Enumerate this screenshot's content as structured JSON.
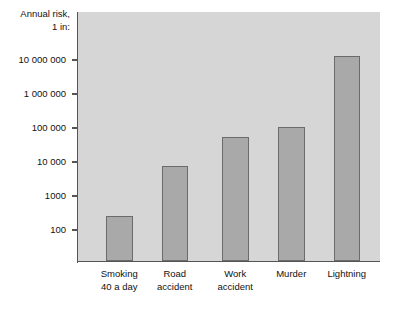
{
  "chart_data": {
    "type": "bar",
    "title": "",
    "subtitle": "",
    "ylabel": "Annual risk,\n1 in:",
    "ylabel_lines": [
      "Annual risk,",
      "1 in:"
    ],
    "xlabel": "",
    "yscale": "log",
    "ylim": [
      100,
      30000000
    ],
    "grid": false,
    "legend": "none",
    "categories": [
      "Smoking\n40 a day",
      "Road\naccident",
      "Work\naccident",
      "Murder",
      "Lightning"
    ],
    "category_lines": [
      [
        "Smoking",
        "40 a day"
      ],
      [
        "Road",
        "accident"
      ],
      [
        "Work",
        "accident"
      ],
      [
        "Murder",
        ""
      ],
      [
        "Lightning",
        ""
      ]
    ],
    "values": [
      250,
      7500,
      55000,
      110000,
      13000000
    ],
    "ytick_values": [
      100,
      1000,
      10000,
      100000,
      1000000,
      10000000
    ],
    "ytick_labels": [
      "100",
      "1000",
      "10 000",
      "100 000",
      "1 000 000",
      "10 000 000"
    ],
    "colors": {
      "bar_fill": "#a9a9a9",
      "bar_border": "#6b6b6b",
      "plot_background": "#d6d6d6",
      "page_background": "#ffffff",
      "axis": "#555555",
      "text": "#111111"
    }
  }
}
